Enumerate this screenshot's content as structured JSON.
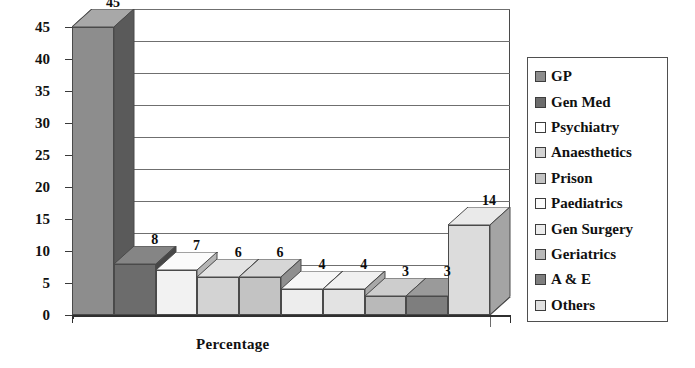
{
  "chart_data": {
    "type": "bar",
    "title": "",
    "subtitle": "",
    "xlabel": "Percentage",
    "ylabel": "",
    "categories": [
      "GP",
      "Gen Med",
      "Psychiatry",
      "Anaesthetics",
      "Prison",
      "Paediatrics",
      "Gen Surgery",
      "Geriatrics",
      "A & E",
      "Others"
    ],
    "values": [
      45,
      8,
      7,
      6,
      6,
      4,
      4,
      3,
      3,
      14
    ],
    "data_labels": [
      "45",
      "8",
      "7",
      "6",
      "6",
      "4",
      "4",
      "3",
      "3",
      "14"
    ],
    "ylim": [
      0,
      45
    ],
    "ytick_labels": [
      "0",
      "5",
      "10",
      "15",
      "20",
      "25",
      "30",
      "35",
      "40",
      "45"
    ],
    "ytick_values": [
      0,
      5,
      10,
      15,
      20,
      25,
      30,
      35,
      40,
      45
    ],
    "grid": true,
    "grid_axis": "y",
    "legend_position": "right",
    "three_d": true,
    "bar_colors": [
      "#8d8d8d",
      "#6c6c6c",
      "#f2f2f2",
      "#d3d3d3",
      "#c3c3c3",
      "#ededed",
      "#e3e3e3",
      "#b9b9b9",
      "#7e7e7e",
      "#dcdcdc"
    ],
    "bar_side_colors": [
      "#5a5a5a",
      "#474747",
      "#b5b5b5",
      "#9d9d9d",
      "#8f8f8f",
      "#b0b0b0",
      "#a8a8a8",
      "#898989",
      "#565656",
      "#a4a4a4"
    ],
    "bar_top_colors": [
      "#a8a8a8",
      "#858585",
      "#fbfbfb",
      "#e3e3e3",
      "#d6d6d6",
      "#f6f6f6",
      "#f0f0f0",
      "#cdcdcd",
      "#9a9a9a",
      "#eaeaea"
    ]
  },
  "axis": {
    "x_title": "Percentage"
  },
  "legend": {
    "items": [
      {
        "label": "GP",
        "color": "#8d8d8d"
      },
      {
        "label": "Gen Med",
        "color": "#6c6c6c"
      },
      {
        "label": "Psychiatry",
        "color": "#ffffff"
      },
      {
        "label": "Anaesthetics",
        "color": "#d3d3d3"
      },
      {
        "label": "Prison",
        "color": "#c3c3c3"
      },
      {
        "label": "Paediatrics",
        "color": "#fbfbfb"
      },
      {
        "label": "Gen Surgery",
        "color": "#ececec"
      },
      {
        "label": "Geriatrics",
        "color": "#b9b9b9"
      },
      {
        "label": "A & E",
        "color": "#7e7e7e"
      },
      {
        "label": "Others",
        "color": "#e0e0e0"
      }
    ]
  }
}
